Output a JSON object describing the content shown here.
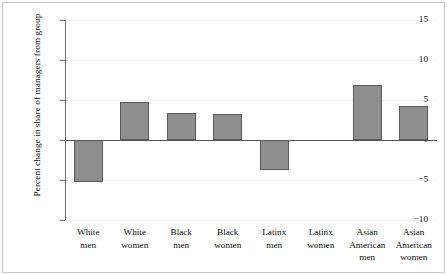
{
  "chart_data": {
    "type": "bar",
    "title": "",
    "xlabel": "",
    "ylabel": "Percent change in share of managers from group",
    "categories": [
      "White men",
      "White women",
      "Black men",
      "Black women",
      "Latinx men",
      "Latinx women",
      "Asian American men",
      "Asian American women"
    ],
    "category_lines": [
      [
        "White",
        "men"
      ],
      [
        "White",
        "women"
      ],
      [
        "Black",
        "men"
      ],
      [
        "Black",
        "women"
      ],
      [
        "Latinx",
        "men"
      ],
      [
        "Latinx",
        "women"
      ],
      [
        "Asian",
        "American",
        "men"
      ],
      [
        "Asian",
        "American",
        "women"
      ]
    ],
    "values": [
      -5.25,
      4.75,
      3.4,
      3.3,
      -3.75,
      0.0,
      6.9,
      4.25
    ],
    "ylim": [
      -10,
      15
    ],
    "yticks": [
      15,
      10,
      5,
      0,
      -5,
      -10
    ],
    "ytick_labels": [
      "15",
      "10",
      "5",
      "0",
      "-5",
      "-10"
    ],
    "grid": true,
    "legend": "none",
    "bar_color": "#8e8e8e",
    "bar_edge_color": "#5a5a5a",
    "axis_color": "#6e6e6e",
    "zero_line_color": "#555555"
  }
}
